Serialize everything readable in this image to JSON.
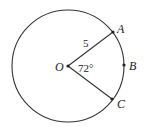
{
  "diagram": {
    "type": "circle-sector",
    "center": {
      "label": "O"
    },
    "points": [
      {
        "label": "A"
      },
      {
        "label": "B"
      },
      {
        "label": "C"
      }
    ],
    "radius_label": "5",
    "angle_label": "72°",
    "colors": {
      "stroke": "#333333",
      "background": "#ffffff"
    }
  }
}
